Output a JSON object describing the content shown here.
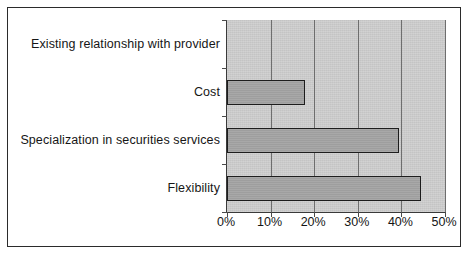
{
  "chart_data": {
    "type": "bar",
    "orientation": "horizontal",
    "title": "",
    "subtitle": "",
    "xlabel": "",
    "ylabel": "",
    "categories": [
      "Existing relationship with provider",
      "Cost",
      "Specialization in securities services",
      "Flexibility"
    ],
    "values": [
      0,
      18,
      39.5,
      44.5
    ],
    "value_labels": [
      "0%",
      "18%",
      "39.5%",
      "44.5%"
    ],
    "xlim": [
      0,
      50
    ],
    "xtick_values": [
      0,
      10,
      20,
      30,
      40,
      50
    ],
    "xtick_labels": [
      "0%",
      "10%",
      "20%",
      "30%",
      "40%",
      "50%"
    ],
    "grid": "vertical-only",
    "legend": null,
    "series": [
      {
        "name": "Share of respondents",
        "values": [
          0,
          18,
          39.5,
          44.5
        ]
      }
    ],
    "annotations": []
  },
  "style": {
    "plot_background": "#c4c4c4",
    "bar_fill": "#9e9e9e",
    "bar_border": "#1d1d1d",
    "gridline_color": "#6e6e6e",
    "axis_color": "#3a3a3a",
    "frame_border": "#2b2b2b",
    "text_color": "#161616",
    "figure_background": "#ffffff"
  }
}
